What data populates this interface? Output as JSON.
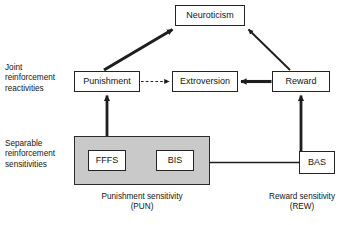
{
  "figure": {
    "type": "path-model-diagram",
    "background": "#ffffff",
    "panel_fill": "#c9c9c9",
    "line_color": "#1e1e1e"
  },
  "nodes": {
    "neuroticism": {
      "label": "Neuroticism",
      "x": 175,
      "y": 5,
      "w": 70,
      "h": 21
    },
    "punishment": {
      "label": "Punishment",
      "x": 74,
      "y": 71,
      "w": 66,
      "h": 21
    },
    "extroversion": {
      "label": "Extroversion",
      "x": 172,
      "y": 71,
      "w": 66,
      "h": 21
    },
    "reward": {
      "label": "Reward",
      "x": 272,
      "y": 71,
      "w": 58,
      "h": 21
    },
    "fffs": {
      "label": "FFFS",
      "x": 88,
      "y": 150,
      "w": 38,
      "h": 21
    },
    "bis": {
      "label": "BIS",
      "x": 156,
      "y": 150,
      "w": 38,
      "h": 21
    },
    "bas": {
      "label": "BAS",
      "x": 299,
      "y": 151,
      "w": 36,
      "h": 23
    }
  },
  "panels": {
    "punishment_sensitivity": {
      "x": 74,
      "y": 136,
      "w": 136,
      "h": 49
    }
  },
  "side_labels": {
    "joint": {
      "text": "Joint\nreinforcement\nreactivities",
      "x": 5,
      "y": 63
    },
    "separable": {
      "text": "Separable\nreinforcement\nsensitivities",
      "x": 5,
      "y": 139
    }
  },
  "captions": {
    "punishment_sensitivity": {
      "text": "Punishment sensitivity\n(PUN)",
      "x": 66,
      "y": 192,
      "w": 152
    },
    "reward_sensitivity": {
      "text": "Reward sensitivity\n(REW)",
      "x": 253,
      "y": 192,
      "w": 98
    }
  },
  "edges": [
    {
      "name": "punishment-to-neuroticism",
      "style": "thick-solid-arrow"
    },
    {
      "name": "reward-to-neuroticism",
      "style": "thin-solid-arrow"
    },
    {
      "name": "punishment-to-extroversion",
      "style": "dashed-arrow"
    },
    {
      "name": "reward-to-extroversion",
      "style": "thick-solid-arrow"
    },
    {
      "name": "pun-panel-to-punishment",
      "style": "thick-solid-arrow"
    },
    {
      "name": "bas-to-reward",
      "style": "thick-solid-arrow"
    },
    {
      "name": "fffs-to-bis",
      "style": "thin-solid-arrow"
    },
    {
      "name": "bas-to-bis",
      "style": "thin-solid-arrow"
    }
  ]
}
